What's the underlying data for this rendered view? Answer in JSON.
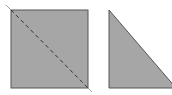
{
  "diagram": {
    "colors": {
      "fill": "#a6a6a6",
      "stroke": "#555555",
      "dash": "#333333",
      "background": "#ffffff"
    },
    "square": {
      "x": 11,
      "y": 10,
      "size": 77
    },
    "diagonal": {
      "x1": 6,
      "y1": 5,
      "x2": 91,
      "y2": 92,
      "style": "dashed"
    },
    "triangle": {
      "points": "109,10 109,88 175,88"
    }
  }
}
